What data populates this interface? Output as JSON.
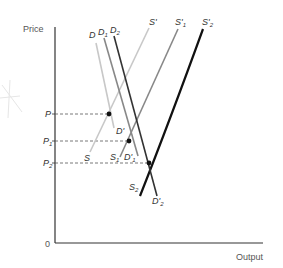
{
  "diagram": {
    "type": "supply-demand",
    "axes": {
      "y_label": "Price",
      "x_label": "Output",
      "origin_label": "0"
    },
    "price_levels": [
      {
        "label": "P",
        "sub": "",
        "y": 114
      },
      {
        "label": "P",
        "sub": "1",
        "y": 141
      },
      {
        "label": "P",
        "sub": "2",
        "y": 163
      }
    ],
    "demand_curves": [
      {
        "label": "D",
        "sub": "",
        "color": "#c8c8c8",
        "end_label": "D'",
        "end_sub": ""
      },
      {
        "label": "D",
        "sub": "1",
        "color": "#888888",
        "end_label": "D'",
        "end_sub": "1"
      },
      {
        "label": "D",
        "sub": "2",
        "color": "#333333",
        "end_label": "D'",
        "end_sub": "2"
      }
    ],
    "supply_curves": [
      {
        "label": "S",
        "sub": "",
        "color": "#c8c8c8",
        "top_label": "S'",
        "top_sub": ""
      },
      {
        "label": "S",
        "sub": "1",
        "color": "#888888",
        "top_label": "S'",
        "top_sub": "1"
      },
      {
        "label": "S",
        "sub": "2",
        "color": "#111111",
        "top_label": "S'",
        "top_sub": "2"
      }
    ],
    "equilibria": [
      {
        "name": "E",
        "x": 109,
        "y": 114
      },
      {
        "name": "E1",
        "x": 129,
        "y": 141
      },
      {
        "name": "E2",
        "x": 149,
        "y": 163
      }
    ]
  }
}
